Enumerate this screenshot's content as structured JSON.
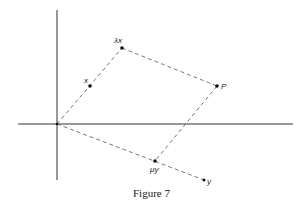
{
  "figure": {
    "caption": "Figure 7",
    "points": {
      "origin": {
        "label": "",
        "x": 57,
        "y": 124
      },
      "lambda_x": {
        "label": "λx",
        "x": 122,
        "y": 48
      },
      "x": {
        "label": "x",
        "x": 90,
        "y": 86
      },
      "P": {
        "label": "P",
        "x": 217,
        "y": 86
      },
      "mu_y": {
        "label": "μy",
        "x": 155,
        "y": 161
      },
      "y": {
        "label": "y",
        "x": 204,
        "y": 180
      }
    },
    "colors": {
      "line": "#333333",
      "dashed": "#555555",
      "point": "#111111"
    }
  }
}
